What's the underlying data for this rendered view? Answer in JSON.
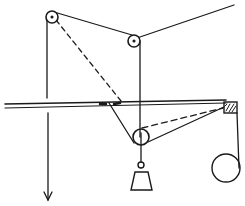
{
  "diagram": {
    "background": "#ffffff",
    "stroke": "#1a1a1a",
    "components": [
      {
        "id": "top-left-pulley",
        "type": "pulley",
        "cx": 52,
        "cy": 17,
        "r": 6
      },
      {
        "id": "middle-pulley",
        "type": "pulley",
        "cx": 134,
        "cy": 41,
        "r": 6
      },
      {
        "id": "lower-pulley",
        "type": "pulley",
        "cx": 141,
        "cy": 137,
        "r": 8
      },
      {
        "id": "hook-ring",
        "type": "ring",
        "cx": 141,
        "cy": 165,
        "r": 3
      },
      {
        "id": "weight",
        "type": "trapezoid",
        "points": "131,190 152,190 148,172 135,172"
      },
      {
        "id": "corner-block",
        "type": "hatched-block",
        "x": 224,
        "y": 103,
        "w": 13,
        "h": 10
      },
      {
        "id": "roller",
        "type": "circle",
        "cx": 226,
        "cy": 168,
        "r": 15
      },
      {
        "id": "down-arrow",
        "type": "arrow",
        "x": 48,
        "y1": 112,
        "y2": 200
      }
    ],
    "labels": []
  }
}
